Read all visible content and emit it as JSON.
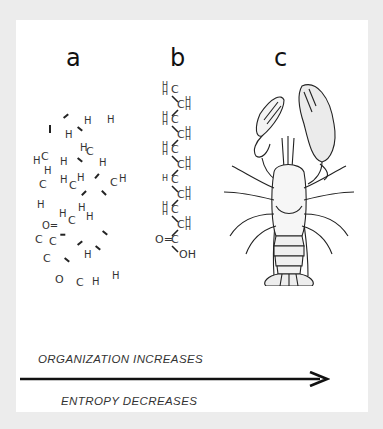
{
  "figure": {
    "labels": {
      "a": "a",
      "b": "b",
      "c": "c"
    },
    "panel_a": {
      "description": "disordered atoms of a fatty acid",
      "atoms": [
        {
          "t": "H",
          "x": 68,
          "y": 96
        },
        {
          "t": "H",
          "x": 91,
          "y": 95
        },
        {
          "t": "H",
          "x": 49,
          "y": 110
        },
        {
          "t": "H",
          "x": 64,
          "y": 123
        },
        {
          "t": "C",
          "x": 70,
          "y": 126
        },
        {
          "t": "H",
          "x": 17,
          "y": 136
        },
        {
          "t": "C",
          "x": 25,
          "y": 131
        },
        {
          "t": "H",
          "x": 44,
          "y": 137
        },
        {
          "t": "H",
          "x": 83,
          "y": 138
        },
        {
          "t": "H",
          "x": 28,
          "y": 146
        },
        {
          "t": "C",
          "x": 23,
          "y": 159
        },
        {
          "t": "H",
          "x": 44,
          "y": 155
        },
        {
          "t": "C",
          "x": 53,
          "y": 160
        },
        {
          "t": "H",
          "x": 61,
          "y": 153
        },
        {
          "t": "C",
          "x": 94,
          "y": 157
        },
        {
          "t": "H",
          "x": 103,
          "y": 154
        },
        {
          "t": "H",
          "x": 21,
          "y": 180
        },
        {
          "t": "H",
          "x": 62,
          "y": 183
        },
        {
          "t": "H",
          "x": 43,
          "y": 189
        },
        {
          "t": "C",
          "x": 52,
          "y": 195
        },
        {
          "t": "H",
          "x": 70,
          "y": 192
        },
        {
          "t": "O=",
          "x": 26,
          "y": 201
        },
        {
          "t": "C",
          "x": 19,
          "y": 214
        },
        {
          "t": "C",
          "x": 33,
          "y": 216
        },
        {
          "t": "H",
          "x": 68,
          "y": 230
        },
        {
          "t": "C",
          "x": 27,
          "y": 233
        },
        {
          "t": "O",
          "x": 39,
          "y": 254
        },
        {
          "t": "C",
          "x": 60,
          "y": 257
        },
        {
          "t": "H",
          "x": 76,
          "y": 257
        },
        {
          "t": "H",
          "x": 96,
          "y": 251
        }
      ]
    },
    "panel_b": {
      "description": "ordered fatty acid chain",
      "rows": [
        {
          "left": "H\nH",
          "atom": "C"
        },
        {
          "right": "H\nH",
          "atom": "C"
        },
        {
          "left": "H\nH",
          "atom": "C"
        },
        {
          "right": "H\nH",
          "atom": "C"
        },
        {
          "left": "H\nH",
          "atom": "C"
        },
        {
          "right": "H\nH",
          "atom": "C"
        },
        {
          "left": "H",
          "atom": "C"
        },
        {
          "right": "H\nH",
          "atom": "C"
        },
        {
          "left": "H\nH",
          "atom": "C"
        },
        {
          "right": "H\nH",
          "atom": "C"
        },
        {
          "left": "O=",
          "atom": "C"
        },
        {
          "right": "",
          "atom": "OH"
        }
      ]
    },
    "panel_c": {
      "description": "lobster illustration",
      "icon": "lobster-icon"
    }
  },
  "captions": {
    "top": "ORGANIZATION  INCREASES",
    "bottom": "ENTROPY  DECREASES"
  },
  "colors": {
    "background": "#ececec",
    "panel": "#ffffff",
    "ink": "#111111"
  }
}
